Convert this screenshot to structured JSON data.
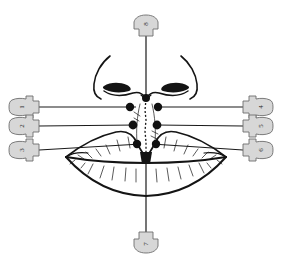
{
  "figure": {
    "background_color": "#ffffff",
    "ink_color": "#141414",
    "pin_fill_color": "#d7d7d7",
    "pin_stroke_color": "#6e6e6e",
    "dot_color": "#111111"
  },
  "labels": [
    {
      "id": "label-1",
      "number": "1",
      "side": "left",
      "row": 1,
      "pin_cx": 25,
      "pin_cy": 107,
      "line_from_x": 39,
      "line_from_y": 107,
      "line_to_x": 136,
      "line_to_y": 107,
      "rotate": -90
    },
    {
      "id": "label-2",
      "number": "2",
      "side": "left",
      "row": 2,
      "pin_cx": 25,
      "pin_cy": 126,
      "line_from_x": 39,
      "line_from_y": 126,
      "line_to_x": 136,
      "line_to_y": 125,
      "rotate": -90
    },
    {
      "id": "label-3",
      "number": "3",
      "side": "left",
      "row": 3,
      "pin_cx": 25,
      "pin_cy": 150,
      "line_from_x": 39,
      "line_from_y": 150,
      "line_to_x": 140,
      "line_to_y": 144,
      "rotate": -90
    },
    {
      "id": "label-4",
      "number": "4",
      "side": "right",
      "row": 1,
      "pin_cx": 257,
      "pin_cy": 107,
      "line_from_x": 243,
      "line_from_y": 107,
      "line_to_x": 157,
      "line_to_y": 107,
      "rotate": -90
    },
    {
      "id": "label-5",
      "number": "5",
      "side": "right",
      "row": 2,
      "pin_cx": 257,
      "pin_cy": 126,
      "line_from_x": 243,
      "line_from_y": 126,
      "line_to_x": 156,
      "line_to_y": 125,
      "rotate": -90
    },
    {
      "id": "label-6",
      "number": "6",
      "side": "right",
      "row": 3,
      "pin_cx": 257,
      "pin_cy": 150,
      "line_from_x": 243,
      "line_from_y": 150,
      "line_to_x": 152,
      "line_to_y": 144,
      "rotate": -90
    },
    {
      "id": "label-7",
      "number": "7",
      "side": "bottom",
      "row": 0,
      "pin_cx": 146,
      "pin_cy": 245,
      "line_from_x": 146,
      "line_from_y": 232,
      "line_to_x": 146,
      "line_to_y": 160,
      "rotate": -90
    },
    {
      "id": "label-8",
      "number": "8",
      "side": "top",
      "row": 0,
      "pin_cx": 146,
      "pin_cy": 22,
      "line_from_x": 146,
      "line_from_y": 36,
      "line_to_x": 146,
      "line_to_y": 96,
      "rotate": -90
    }
  ],
  "landmarks": [
    {
      "id": "dot-left-1",
      "cx": 130,
      "cy": 107,
      "r": 4.2,
      "name": "left-philtrum-column-top"
    },
    {
      "id": "dot-right-1",
      "cx": 158,
      "cy": 107,
      "r": 4.2,
      "name": "right-philtrum-column-top"
    },
    {
      "id": "dot-left-2",
      "cx": 133,
      "cy": 125,
      "r": 4.4,
      "name": "left-philtrum-column-mid"
    },
    {
      "id": "dot-right-2",
      "cx": 157,
      "cy": 125,
      "r": 4.4,
      "name": "right-philtrum-column-mid"
    },
    {
      "id": "dot-left-3",
      "cx": 137,
      "cy": 144,
      "r": 4.2,
      "name": "left-cupids-bow-peak"
    },
    {
      "id": "dot-right-3",
      "cx": 156,
      "cy": 144,
      "r": 4.2,
      "name": "right-cupids-bow-peak"
    },
    {
      "id": "dot-subnasal",
      "cx": 146,
      "cy": 98,
      "r": 4.0,
      "name": "subnasale"
    },
    {
      "id": "dot-tubercle",
      "cx": 146,
      "cy": 158,
      "r": 5.0,
      "name": "upper-lip-tubercle"
    }
  ],
  "anatomy": {
    "nose_label": "nose",
    "nostril_left_label": "left-nostril",
    "nostril_right_label": "right-nostril",
    "upper_lip_label": "upper-lip",
    "lower_lip_label": "lower-lip",
    "philtrum_label": "philtrum"
  },
  "axis": {
    "vertical_midline_label": "facial-midline",
    "top_y": 36,
    "bottom_y": 232
  }
}
